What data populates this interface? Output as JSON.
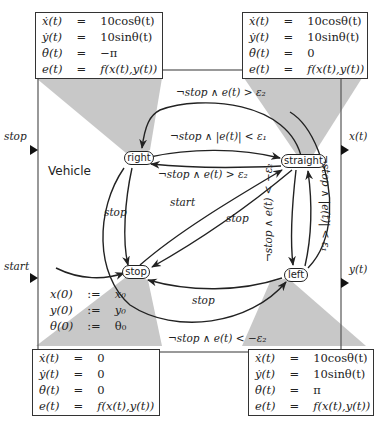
{
  "diagram": {
    "type": "hybrid-automaton",
    "component_name": "Vehicle",
    "colors": {
      "line": "#222222",
      "frame": "#555555",
      "shade": "#c8c8c8",
      "box_border": "#333333"
    },
    "inputs": [
      {
        "name": "stop"
      },
      {
        "name": "start"
      }
    ],
    "outputs": [
      {
        "name": "x(t)"
      },
      {
        "name": "y(t)"
      }
    ],
    "states": [
      {
        "id": "right",
        "label": "right"
      },
      {
        "id": "straight",
        "label": "straight"
      },
      {
        "id": "stop",
        "label": "stop"
      },
      {
        "id": "left",
        "label": "left"
      }
    ],
    "initialization": {
      "rows": [
        {
          "lhs": "x(0)",
          "op": ":=",
          "rhs": "x₀"
        },
        {
          "lhs": "y(0)",
          "op": ":=",
          "rhs": "y₀"
        },
        {
          "lhs": "θ(0)",
          "op": ":=",
          "rhs": "θ₀"
        }
      ]
    },
    "dynamics_boxes": {
      "right": {
        "rows": [
          {
            "lhs": "ẋ(t)",
            "op": "=",
            "rhs": "10cosθ(t)"
          },
          {
            "lhs": "ẏ(t)",
            "op": "=",
            "rhs": "10sinθ(t)"
          },
          {
            "lhs": "θ̇(t)",
            "op": "=",
            "rhs": "−π"
          },
          {
            "lhs": "e(t)",
            "op": "=",
            "rhs": "f(x(t),y(t))"
          }
        ]
      },
      "straight": {
        "rows": [
          {
            "lhs": "ẋ(t)",
            "op": "=",
            "rhs": "10cosθ(t)"
          },
          {
            "lhs": "ẏ(t)",
            "op": "=",
            "rhs": "10sinθ(t)"
          },
          {
            "lhs": "θ̇(t)",
            "op": "=",
            "rhs": "0"
          },
          {
            "lhs": "e(t)",
            "op": "=",
            "rhs": "f(x(t),y(t))"
          }
        ]
      },
      "stop": {
        "rows": [
          {
            "lhs": "ẋ(t)",
            "op": "=",
            "rhs": "0"
          },
          {
            "lhs": "ẏ(t)",
            "op": "=",
            "rhs": "0"
          },
          {
            "lhs": "θ̇(t)",
            "op": "=",
            "rhs": "0"
          },
          {
            "lhs": "e(t)",
            "op": "=",
            "rhs": "f(x(t),y(t))"
          }
        ]
      },
      "left": {
        "rows": [
          {
            "lhs": "ẋ(t)",
            "op": "=",
            "rhs": "10cosθ(t)"
          },
          {
            "lhs": "ẏ(t)",
            "op": "=",
            "rhs": "10sinθ(t)"
          },
          {
            "lhs": "θ̇(t)",
            "op": "=",
            "rhs": "π"
          },
          {
            "lhs": "e(t)",
            "op": "=",
            "rhs": "f(x(t),y(t))"
          }
        ]
      }
    },
    "transitions": [
      {
        "from": "straight",
        "to": "right",
        "label": "¬stop ∧ e(t) > ε₂",
        "position": "top-arc"
      },
      {
        "from": "right",
        "to": "straight",
        "label": "¬stop ∧ |e(t)| < ε₁"
      },
      {
        "from": "straight",
        "to": "right",
        "label": "¬stop ∧ e(t) > ε₂"
      },
      {
        "from": "right",
        "to": "stop",
        "label": "stop"
      },
      {
        "from": "stop",
        "to": "straight",
        "label": "start"
      },
      {
        "from": "straight",
        "to": "stop",
        "label": "stop"
      },
      {
        "from": "straight",
        "to": "left",
        "label": "¬stop ∧ e(t) < −ε₂"
      },
      {
        "from": "left",
        "to": "straight",
        "label": "¬stop ∧ |e(t)| < ε₁"
      },
      {
        "from": "left",
        "to": "stop",
        "label": "stop"
      },
      {
        "from": "right",
        "to": "left",
        "label": "¬stop ∧ e(t) < −ε₂",
        "position": "bottom-arc"
      },
      {
        "from": "initial",
        "to": "stop",
        "label": ""
      }
    ]
  }
}
